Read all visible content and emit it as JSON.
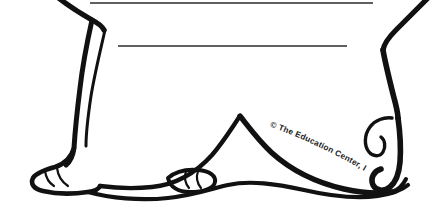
{
  "canvas": {
    "width": 430,
    "height": 214,
    "background_color": "#FFFFFF",
    "ink_color": "#111111",
    "title": "Animal Body Worksheet Clipart"
  },
  "artwork": {
    "subject_name": "cartoon-animal-lower-body",
    "description": "Black line-art outline of the lower half of a cartoon animal showing two front legs with paws, a rounded body, and a curled hind limb at right",
    "style": "black-and-white line art",
    "parts": [
      {
        "name": "left-leg",
        "label": "Left Leg"
      },
      {
        "name": "left-paw",
        "label": "Left Paw"
      },
      {
        "name": "center-paw",
        "label": "Center Paw"
      },
      {
        "name": "body-outline",
        "label": "Body Outline"
      },
      {
        "name": "right-arm",
        "label": "Right Arm"
      },
      {
        "name": "right-hind-limb",
        "label": "Right Hind Limb"
      }
    ]
  },
  "writing_lines": {
    "label": "Blank Writing Lines",
    "count": 2,
    "color": "#2B2B2B",
    "lines": [
      {
        "label": "Line 1",
        "x1": 90,
        "y1": 3,
        "x2": 373,
        "y2": 3,
        "thickness": 1.6
      },
      {
        "label": "Line 2",
        "x1": 118,
        "y1": 46,
        "x2": 347,
        "y2": 46,
        "thickness": 1.4
      }
    ]
  },
  "copyright": {
    "text": "© The Education Center, Inc.",
    "symbol": "©",
    "body": "The Education Center, Inc.",
    "color": "#1A1A1A",
    "font_size": 8.2,
    "placement": "curved along the lower body contour"
  }
}
